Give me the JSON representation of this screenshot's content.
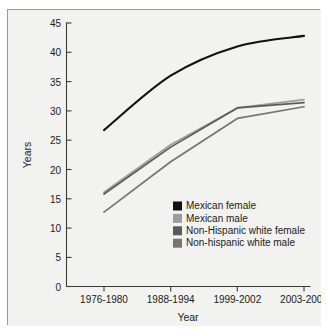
{
  "chart_data": {
    "type": "line",
    "title": "",
    "xlabel": "Year",
    "ylabel": "Years",
    "categories": [
      "1976-1980",
      "1988-1994",
      "1999-2002",
      "2003-2004"
    ],
    "ylim": [
      0,
      45
    ],
    "yticks": [
      0,
      5,
      10,
      15,
      20,
      25,
      30,
      35,
      40,
      45
    ],
    "grid": false,
    "legend_position": "center-right-inside",
    "series": [
      {
        "name": "Mexican female",
        "color": "#111111",
        "values": [
          26.7,
          36.0,
          41.0,
          42.8
        ],
        "smooth": true
      },
      {
        "name": "Mexican male",
        "color": "#9d9d9d",
        "values": [
          16.1,
          24.2,
          30.5,
          31.9
        ],
        "smooth": false
      },
      {
        "name": "Non-Hispanic white female",
        "color": "#5a5a5a",
        "values": [
          15.8,
          23.8,
          30.5,
          31.4
        ],
        "smooth": false
      },
      {
        "name": "Non-hispanic white male",
        "color": "#757575",
        "values": [
          12.7,
          21.3,
          28.7,
          30.7
        ],
        "smooth": false
      }
    ]
  },
  "axis": {
    "y_title": "Years",
    "x_title": "Year",
    "y_tick_labels": [
      "45",
      "40",
      "35",
      "30",
      "25",
      "20",
      "15",
      "10",
      "5",
      "0"
    ],
    "x_tick_labels": [
      "1976-1980",
      "1988-1994",
      "1999-2002",
      "2003-2004"
    ]
  },
  "legend": {
    "entries": [
      {
        "label": "Mexican female",
        "swatch": "#111111"
      },
      {
        "label": "Mexican male",
        "swatch": "#9d9d9d"
      },
      {
        "label": "Non-Hispanic white female",
        "swatch": "#5a5a5a"
      },
      {
        "label": "Non-hispanic white male",
        "swatch": "#757575"
      }
    ]
  }
}
